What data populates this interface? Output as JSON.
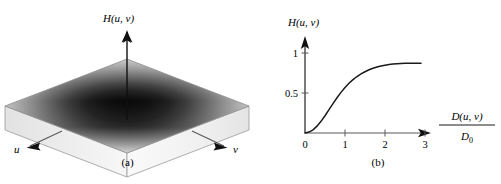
{
  "figure": {
    "panels": [
      {
        "id": "a",
        "caption": "(a)",
        "type": "surface-3d",
        "vertical_axis_label": "H(u, v)",
        "axis_u_label": "u",
        "axis_v_label": "v",
        "description": "Perspective plot of a highpass filter transfer function on a square slab"
      },
      {
        "id": "b",
        "caption": "(b)",
        "type": "line-plot",
        "y_axis_label": "H(u, v)",
        "x_axis_label_numerator": "D(u, v)",
        "x_axis_label_denominator": "D",
        "x_axis_label_denominator_sub": "0"
      }
    ]
  },
  "chart_data": {
    "type": "line",
    "title": "",
    "subtitle": "",
    "xlabel": "D(u, v) / D0",
    "ylabel": "H(u, v)",
    "xlim": [
      0,
      3.6
    ],
    "ylim": [
      0,
      1.12
    ],
    "grid": false,
    "legend": null,
    "x_ticks": [
      0,
      1,
      2,
      3
    ],
    "x_tick_labels": [
      "0",
      "1",
      "2",
      "3"
    ],
    "y_ticks": [
      0.5,
      1
    ],
    "y_tick_labels": [
      "0.5",
      "1"
    ],
    "series": [
      {
        "name": "H(u, v)",
        "color": "#1a1a1a",
        "x": [
          0.0,
          0.1,
          0.2,
          0.3,
          0.4,
          0.5,
          0.6,
          0.7,
          0.8,
          0.9,
          1.0,
          1.1,
          1.2,
          1.3,
          1.4,
          1.5,
          1.6,
          1.7,
          1.8,
          1.9,
          2.0,
          2.1,
          2.2,
          2.3,
          2.4,
          2.5,
          2.6,
          2.7,
          2.8,
          2.9
        ],
        "y": [
          0.0,
          0.012,
          0.04,
          0.086,
          0.146,
          0.216,
          0.292,
          0.368,
          0.441,
          0.508,
          0.568,
          0.621,
          0.667,
          0.706,
          0.739,
          0.766,
          0.79,
          0.809,
          0.825,
          0.838,
          0.848,
          0.856,
          0.862,
          0.866,
          0.869,
          0.871,
          0.872,
          0.873,
          0.873,
          0.873
        ]
      }
    ],
    "annotations": []
  },
  "surface_data": {
    "type": "heatmap",
    "description": "square surface, dark valley (near 0) at center, bright plateau (near 1) toward the corners",
    "center_value": 0,
    "edge_value": 1,
    "colors": {
      "low": "#0d0d0d",
      "high": "#f2f2f2",
      "slab_side": "#eaeaea",
      "slab_front": "#f5f5f5",
      "outline": "#8c8c8c"
    }
  }
}
